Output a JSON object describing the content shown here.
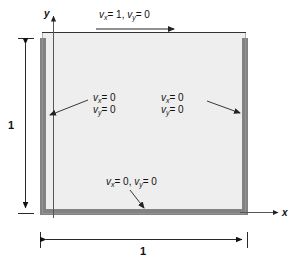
{
  "figure": {
    "colors": {
      "wall": "#828282",
      "interior": "#eeeeee",
      "line": "#333333",
      "text": "#111111",
      "background": "#ffffff"
    },
    "axes": {
      "x_label": "x",
      "y_label": "y"
    },
    "dimensions": {
      "width_label": "1",
      "height_label": "1"
    },
    "boundary_conditions": {
      "top": {
        "name": "moving-lid",
        "vx": "v",
        "vx_sub": "x",
        "vx_eq": "= 1,",
        "vy": "v",
        "vy_sub": "y",
        "vy_eq": "= 0",
        "full_text": "vx = 1, vy = 0"
      },
      "left": {
        "name": "left-wall",
        "line1_var": "v",
        "line1_sub": "x",
        "line1_eq": "= 0",
        "line2_var": "v",
        "line2_sub": "y",
        "line2_eq": "= 0",
        "full_text": "vx = 0, vy = 0"
      },
      "right": {
        "name": "right-wall",
        "line1_var": "v",
        "line1_sub": "x",
        "line1_eq": "= 0",
        "line2_var": "v",
        "line2_sub": "y",
        "line2_eq": "= 0",
        "full_text": "vx = 0, vy = 0"
      },
      "bottom": {
        "name": "bottom-wall",
        "vx": "v",
        "vx_sub": "x",
        "vx_eq": "= 0,",
        "vy": "v",
        "vy_sub": "y",
        "vy_eq": "= 0",
        "full_text": "vx = 0, vy = 0"
      }
    }
  }
}
